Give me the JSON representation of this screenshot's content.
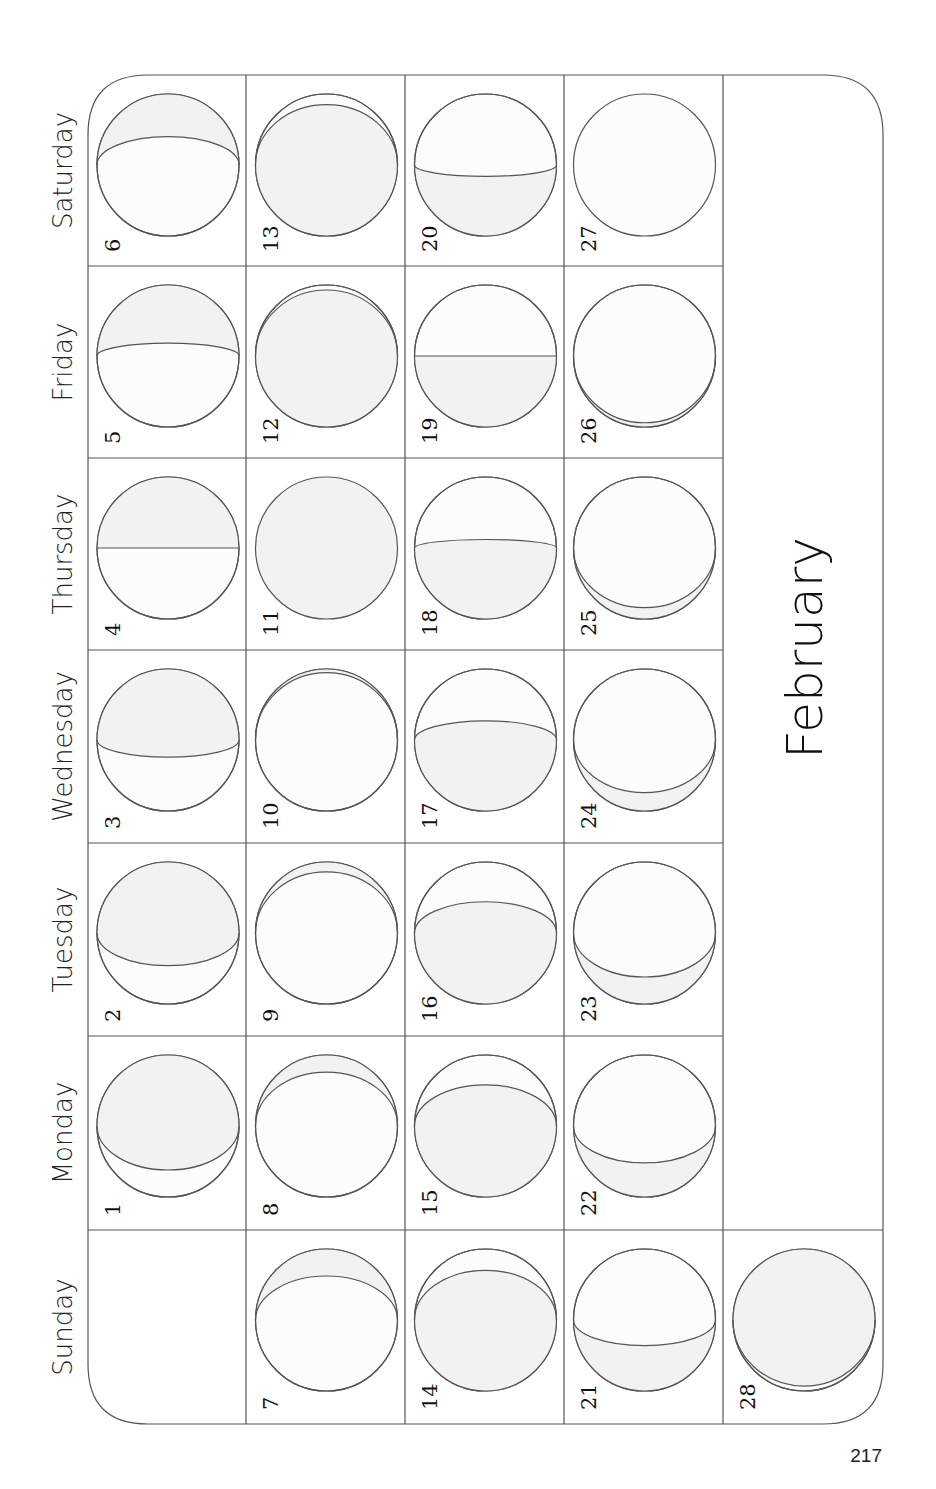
{
  "page": {
    "month_title": "February",
    "page_number": "217",
    "colors": {
      "line": "#555555",
      "shaded": "#f2f2f2",
      "unshaded": "#fcfcfc",
      "text": "#111111"
    }
  },
  "weekdays": [
    {
      "label": "Saturday"
    },
    {
      "label": "Friday"
    },
    {
      "label": "Thursday"
    },
    {
      "label": "Wednesday"
    },
    {
      "label": "Tuesday"
    },
    {
      "label": "Monday"
    },
    {
      "label": "Sunday"
    }
  ],
  "days": [
    {
      "date": "1",
      "weekday": "Monday",
      "week": 0,
      "shade": "top",
      "k": 0.62
    },
    {
      "date": "2",
      "weekday": "Tuesday",
      "week": 0,
      "shade": "top",
      "k": 0.46
    },
    {
      "date": "3",
      "weekday": "Wednesday",
      "week": 0,
      "shade": "top",
      "k": 0.24
    },
    {
      "date": "4",
      "weekday": "Thursday",
      "week": 0,
      "shade": "top",
      "k": 0.0
    },
    {
      "date": "5",
      "weekday": "Friday",
      "week": 0,
      "shade": "top",
      "k": -0.18
    },
    {
      "date": "6",
      "weekday": "Saturday",
      "week": 0,
      "shade": "top",
      "k": -0.4
    },
    {
      "date": "7",
      "weekday": "Sunday",
      "week": 1,
      "shade": "top",
      "k": -0.62
    },
    {
      "date": "8",
      "weekday": "Monday",
      "week": 1,
      "shade": "top",
      "k": -0.76
    },
    {
      "date": "9",
      "weekday": "Tuesday",
      "week": 1,
      "shade": "top",
      "k": -0.86
    },
    {
      "date": "10",
      "weekday": "Wednesday",
      "week": 1,
      "shade": "top",
      "k": -0.95
    },
    {
      "date": "11",
      "weekday": "Thursday",
      "week": 1,
      "shade": "full",
      "k": 1.0
    },
    {
      "date": "12",
      "weekday": "Friday",
      "week": 1,
      "shade": "bottom",
      "k": -0.93
    },
    {
      "date": "13",
      "weekday": "Saturday",
      "week": 1,
      "shade": "bottom",
      "k": -0.85
    },
    {
      "date": "14",
      "weekday": "Sunday",
      "week": 2,
      "shade": "bottom",
      "k": -0.7
    },
    {
      "date": "15",
      "weekday": "Monday",
      "week": 2,
      "shade": "bottom",
      "k": -0.58
    },
    {
      "date": "16",
      "weekday": "Tuesday",
      "week": 2,
      "shade": "bottom",
      "k": -0.44
    },
    {
      "date": "17",
      "weekday": "Wednesday",
      "week": 2,
      "shade": "bottom",
      "k": -0.27
    },
    {
      "date": "18",
      "weekday": "Thursday",
      "week": 2,
      "shade": "bottom",
      "k": -0.12
    },
    {
      "date": "19",
      "weekday": "Friday",
      "week": 2,
      "shade": "bottom",
      "k": 0.0
    },
    {
      "date": "20",
      "weekday": "Saturday",
      "week": 2,
      "shade": "bottom",
      "k": 0.16
    },
    {
      "date": "21",
      "weekday": "Sunday",
      "week": 3,
      "shade": "bottom",
      "k": 0.36
    },
    {
      "date": "22",
      "weekday": "Monday",
      "week": 3,
      "shade": "bottom",
      "k": 0.52
    },
    {
      "date": "23",
      "weekday": "Tuesday",
      "week": 3,
      "shade": "bottom",
      "k": 0.62
    },
    {
      "date": "24",
      "weekday": "Wednesday",
      "week": 3,
      "shade": "bottom",
      "k": 0.74
    },
    {
      "date": "25",
      "weekday": "Thursday",
      "week": 3,
      "shade": "bottom",
      "k": 0.84
    },
    {
      "date": "26",
      "weekday": "Friday",
      "week": 3,
      "shade": "bottom",
      "k": 0.94
    },
    {
      "date": "27",
      "weekday": "Saturday",
      "week": 3,
      "shade": "none",
      "k": 1.0
    },
    {
      "date": "28",
      "weekday": "Sunday",
      "week": 4,
      "shade": "top",
      "k": 0.93
    }
  ]
}
